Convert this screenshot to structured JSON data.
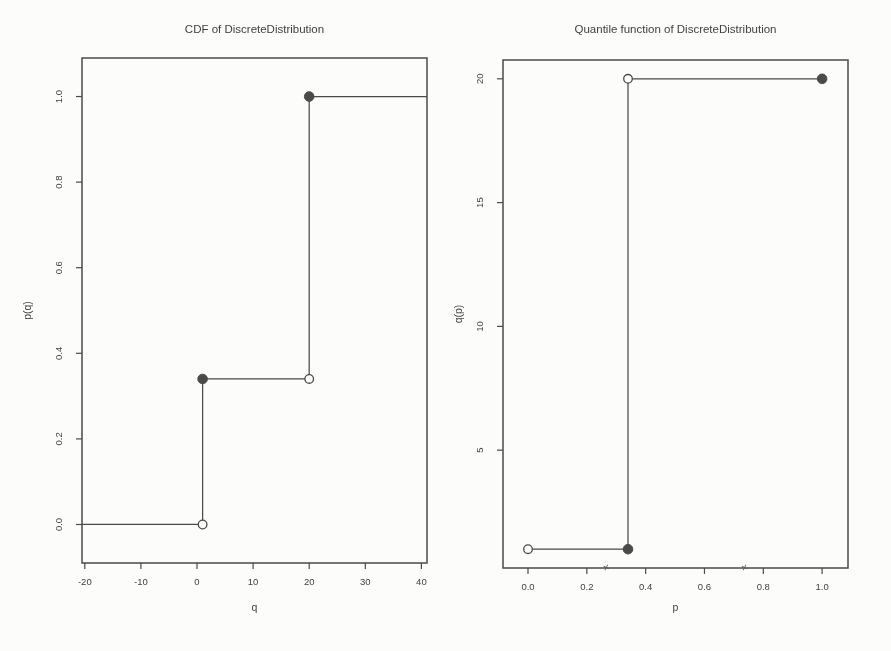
{
  "page": {
    "background_color": "#fcfcfa",
    "ink_color": "#4a4a4a",
    "text_color": "#3f3f3f"
  },
  "chart_data": [
    {
      "type": "line",
      "subtype": "step-function-cdf",
      "title": "CDF of DiscreteDistribution",
      "xlabel": "q",
      "ylabel": "p(q)",
      "xlim": [
        -20.5,
        41
      ],
      "ylim": [
        -0.09,
        1.09
      ],
      "grid": "off",
      "legend": "none",
      "xticks": [
        {
          "v": -20,
          "label": "-20"
        },
        {
          "v": -10,
          "label": "-10"
        },
        {
          "v": 0,
          "label": "0"
        },
        {
          "v": 10,
          "label": "10"
        },
        {
          "v": 20,
          "label": "20"
        },
        {
          "v": 30,
          "label": "30"
        },
        {
          "v": 40,
          "label": "40"
        }
      ],
      "yticks": [
        {
          "v": 0.0,
          "label": "0.0"
        },
        {
          "v": 0.2,
          "label": "0.2"
        },
        {
          "v": 0.4,
          "label": "0.4"
        },
        {
          "v": 0.6,
          "label": "0.6"
        },
        {
          "v": 0.8,
          "label": "0.8"
        },
        {
          "v": 1.0,
          "label": "1.0"
        }
      ],
      "support": [
        1,
        20
      ],
      "cdf_levels": [
        0.0,
        0.34,
        1.0
      ],
      "segments": [
        {
          "x1": -20.5,
          "y1": 0.0,
          "x2": 1,
          "y2": 0.0
        },
        {
          "x1": 1,
          "y1": 0.0,
          "x2": 1,
          "y2": 0.34
        },
        {
          "x1": 1,
          "y1": 0.34,
          "x2": 20,
          "y2": 0.34
        },
        {
          "x1": 20,
          "y1": 0.34,
          "x2": 20,
          "y2": 1.0
        },
        {
          "x1": 20,
          "y1": 1.0,
          "x2": 41,
          "y2": 1.0
        }
      ],
      "points": [
        {
          "x": 1,
          "y": 0.0,
          "style": "open"
        },
        {
          "x": 1,
          "y": 0.34,
          "style": "filled"
        },
        {
          "x": 20,
          "y": 0.34,
          "style": "open"
        },
        {
          "x": 20,
          "y": 1.0,
          "style": "filled"
        }
      ],
      "axis_marks": []
    },
    {
      "type": "line",
      "subtype": "step-function-quantile",
      "title": "Quantile function of DiscreteDistribution",
      "xlabel": "p",
      "ylabel": "q(p)",
      "xlim": [
        -0.085,
        1.088
      ],
      "ylim": [
        0.24,
        20.76
      ],
      "grid": "off",
      "legend": "none",
      "xticks": [
        {
          "v": 0.0,
          "label": "0.0"
        },
        {
          "v": 0.2,
          "label": "0.2"
        },
        {
          "v": 0.4,
          "label": "0.4"
        },
        {
          "v": 0.6,
          "label": "0.6"
        },
        {
          "v": 0.8,
          "label": "0.8"
        },
        {
          "v": 1.0,
          "label": "1.0"
        }
      ],
      "yticks": [
        {
          "v": 5,
          "label": "5"
        },
        {
          "v": 10,
          "label": "10"
        },
        {
          "v": 15,
          "label": "15"
        },
        {
          "v": 20,
          "label": "20"
        }
      ],
      "support": [
        1,
        20
      ],
      "jump_at_p": 0.34,
      "segments": [
        {
          "x1": 0.0,
          "y1": 1,
          "x2": 0.34,
          "y2": 1
        },
        {
          "x1": 0.34,
          "y1": 1,
          "x2": 0.34,
          "y2": 20
        },
        {
          "x1": 0.34,
          "y1": 20,
          "x2": 1.0,
          "y2": 20
        }
      ],
      "points": [
        {
          "x": 0.0,
          "y": 1,
          "style": "open"
        },
        {
          "x": 0.34,
          "y": 1,
          "style": "filled"
        },
        {
          "x": 0.34,
          "y": 20,
          "style": "open"
        },
        {
          "x": 1.0,
          "y": 20,
          "style": "filled"
        }
      ],
      "axis_marks": [
        {
          "x": 0.27,
          "glyph": "×"
        },
        {
          "x": 0.74,
          "glyph": "×"
        }
      ]
    }
  ]
}
